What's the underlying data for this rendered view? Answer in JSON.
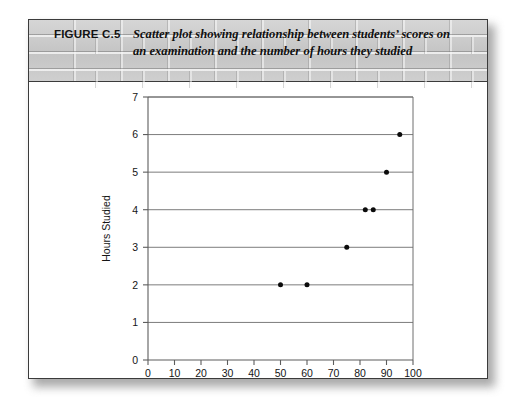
{
  "figure": {
    "number_label": "FIGURE C.5",
    "caption": "Scatter plot showing relationship between students’ scores on an examination and the number of hours they studied"
  },
  "chart_data": {
    "type": "scatter",
    "title": "",
    "xlabel": "Scores on Examination",
    "ylabel": "Hours Studied",
    "xlim": [
      0,
      100
    ],
    "ylim": [
      0,
      7
    ],
    "xticks": [
      0,
      10,
      20,
      30,
      40,
      50,
      60,
      70,
      80,
      90,
      100
    ],
    "yticks": [
      0,
      1,
      2,
      3,
      4,
      5,
      6,
      7
    ],
    "xtick_labels": [
      "0",
      "10",
      "20",
      "30",
      "40",
      "50",
      "60",
      "70",
      "80",
      "90",
      "100"
    ],
    "ytick_labels": [
      "0",
      "1",
      "2",
      "3",
      "4",
      "5",
      "6",
      "7"
    ],
    "grid": "horizontal",
    "legend": "none",
    "marker_color": "#0b0b0b",
    "points": [
      {
        "x": 50,
        "y": 2
      },
      {
        "x": 60,
        "y": 2
      },
      {
        "x": 75,
        "y": 3
      },
      {
        "x": 82,
        "y": 4
      },
      {
        "x": 85,
        "y": 4
      },
      {
        "x": 90,
        "y": 5
      },
      {
        "x": 95,
        "y": 6
      }
    ]
  }
}
